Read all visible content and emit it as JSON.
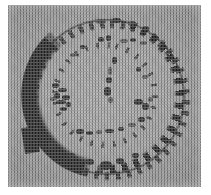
{
  "figure": {
    "kind": "grayscale-micrograph",
    "caption": "",
    "width_px": 211,
    "height_px": 195,
    "page_background": "#ffffff",
    "plate": {
      "left_px": 8,
      "top_px": 5,
      "width_px": 193,
      "height_px": 182,
      "background_gray": "#a8a8a8",
      "texture": "halftone-screen-dots"
    },
    "subject": {
      "shape": "circle",
      "center_x_px": 105,
      "center_y_px": 98,
      "radius_px": 76,
      "description": "roughly circular sectioned structure with a dark outer rim"
    },
    "features": [
      {
        "name": "thick-dark-band",
        "position": "left flank, approx 10 o'clock to 7 o'clock",
        "thickness_px": 15,
        "color": "#262626",
        "terminus": "blunt squared edge at lower-left"
      },
      {
        "name": "beaded-thin-rim",
        "position": "top, right and bottom of circle",
        "thickness_px": 3,
        "color": "#3a3a3a",
        "appearance": "broken dotted chain of dark blobs"
      },
      {
        "name": "inner-speckle-ring",
        "position": "concentric, inside outer rim",
        "radius_px": 50,
        "color": "#3c3c3c",
        "appearance": "faint discontinuous specks"
      },
      {
        "name": "speckle-cluster",
        "position": "left of center",
        "color": "#303030",
        "appearance": "dense cluster of dark granules"
      }
    ],
    "colors": {
      "background_gray": "#a8a8a8",
      "dark_band": "#262626",
      "rim_dark": "#3a3a3a",
      "page_white": "#ffffff"
    }
  }
}
